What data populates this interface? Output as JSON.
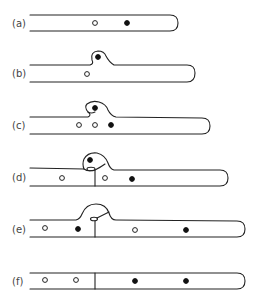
{
  "diagram": {
    "type": "sequential stages of a tubular structure with bulge and partition",
    "panels": [
      {
        "id": "a",
        "label": "(a)",
        "open_dots": 1,
        "filled_dots": 1,
        "bulge": false,
        "partition": false
      },
      {
        "id": "b",
        "label": "(b)",
        "open_dots": 1,
        "filled_dots": 1,
        "bulge": true,
        "partition": false
      },
      {
        "id": "c",
        "label": "(c)",
        "open_dots": 2,
        "filled_dots": 2,
        "bulge": true,
        "partition": false
      },
      {
        "id": "d",
        "label": "(d)",
        "open_dots": 2,
        "filled_dots": 2,
        "bulge": true,
        "partition": true
      },
      {
        "id": "e",
        "label": "(e)",
        "open_dots": 2,
        "filled_dots": 2,
        "bulge": true,
        "partition": true
      },
      {
        "id": "f",
        "label": "(f)",
        "open_dots": 2,
        "filled_dots": 2,
        "bulge": false,
        "partition": true
      }
    ],
    "colors": {
      "stroke": "#222222",
      "background": "#ffffff",
      "filled_dot": "#111111",
      "label": "#444444"
    }
  }
}
